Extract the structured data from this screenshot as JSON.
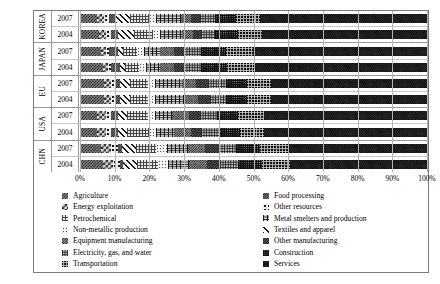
{
  "chart_data": {
    "type": "bar",
    "orientation": "horizontal",
    "stacked": true,
    "normalized": true,
    "title": "",
    "xlabel": "",
    "ylabel": "",
    "xlim": [
      0,
      100
    ],
    "xtick_labels": [
      "0%",
      "10%",
      "20%",
      "30%",
      "40%",
      "50%",
      "60%",
      "70%",
      "80%",
      "90%",
      "100%"
    ],
    "xtick_values": [
      0,
      10,
      20,
      30,
      40,
      50,
      60,
      70,
      80,
      90,
      100
    ],
    "grid": true,
    "legend_position": "bottom",
    "legend_columns": 2,
    "categories": [
      "Agriculture",
      "Energy exploitation",
      "Petrochemical",
      "Non-metallic production",
      "Equipment manufacturing",
      "Electricity, gas, and water",
      "Transportation",
      "Food processing",
      "Other resources",
      "Metal smelters and production",
      "Textiles and apparel",
      "Other manufacturing",
      "Construction",
      "Services"
    ],
    "category_keys": [
      "agriculture",
      "energy",
      "petrochemical",
      "nonmetallic",
      "equipment",
      "electricity",
      "transportation",
      "food",
      "otherres",
      "metal",
      "textiles",
      "othermfg",
      "construction",
      "services"
    ],
    "segment_order": [
      "agriculture",
      "energy",
      "otherres",
      "food",
      "textiles",
      "petrochemical",
      "nonmetallic",
      "metal",
      "equipment",
      "othermfg",
      "electricity",
      "construction",
      "transportation",
      "services"
    ],
    "groups": [
      {
        "name": "KOREA",
        "rows": [
          {
            "year": "2007",
            "values": {
              "agriculture": 5.0,
              "energy": 2.0,
              "otherres": 1.5,
              "food": 2.0,
              "textiles": 4.0,
              "petrochemical": 5.5,
              "nonmetallic": 2.0,
              "metal": 7.0,
              "equipment": 3.0,
              "othermfg": 2.5,
              "electricity": 4.5,
              "construction": 6.0,
              "transportation": 7.0,
              "services": 48.0
            }
          },
          {
            "year": "2004",
            "values": {
              "agriculture": 5.5,
              "energy": 2.0,
              "otherres": 1.5,
              "food": 2.0,
              "textiles": 4.5,
              "petrochemical": 5.5,
              "nonmetallic": 2.0,
              "metal": 6.5,
              "equipment": 3.0,
              "othermfg": 2.5,
              "electricity": 4.0,
              "construction": 6.5,
              "transportation": 7.0,
              "services": 47.5
            }
          }
        ]
      },
      {
        "name": "JAPAN",
        "rows": [
          {
            "year": "2007",
            "values": {
              "agriculture": 6.0,
              "energy": 1.5,
              "otherres": 1.0,
              "food": 2.5,
              "textiles": 1.5,
              "petrochemical": 4.0,
              "nonmetallic": 2.0,
              "metal": 4.5,
              "equipment": 4.0,
              "othermfg": 3.0,
              "electricity": 5.0,
              "construction": 7.0,
              "transportation": 8.0,
              "services": 50.0
            }
          },
          {
            "year": "2004",
            "values": {
              "agriculture": 6.5,
              "energy": 1.5,
              "otherres": 1.0,
              "food": 2.5,
              "textiles": 1.5,
              "petrochemical": 4.0,
              "nonmetallic": 2.0,
              "metal": 4.0,
              "equipment": 4.0,
              "othermfg": 3.0,
              "electricity": 5.0,
              "construction": 7.5,
              "transportation": 8.0,
              "services": 49.5
            }
          }
        ]
      },
      {
        "name": "EU",
        "rows": [
          {
            "year": "2007",
            "values": {
              "agriculture": 7.0,
              "energy": 2.0,
              "otherres": 1.5,
              "food": 1.0,
              "textiles": 3.0,
              "petrochemical": 5.0,
              "nonmetallic": 2.0,
              "metal": 8.0,
              "equipment": 4.0,
              "othermfg": 3.5,
              "electricity": 5.0,
              "construction": 6.0,
              "transportation": 7.0,
              "services": 45.0
            }
          },
          {
            "year": "2004",
            "values": {
              "agriculture": 7.0,
              "energy": 2.0,
              "otherres": 1.5,
              "food": 1.0,
              "textiles": 3.0,
              "petrochemical": 5.0,
              "nonmetallic": 2.0,
              "metal": 8.5,
              "equipment": 4.0,
              "othermfg": 3.5,
              "electricity": 4.5,
              "construction": 6.0,
              "transportation": 7.0,
              "services": 45.0
            }
          }
        ]
      },
      {
        "name": "USA",
        "rows": [
          {
            "year": "2007",
            "values": {
              "agriculture": 5.0,
              "energy": 2.5,
              "otherres": 1.5,
              "food": 2.0,
              "textiles": 2.5,
              "petrochemical": 6.0,
              "nonmetallic": 2.0,
              "metal": 5.0,
              "equipment": 5.0,
              "othermfg": 3.0,
              "electricity": 5.0,
              "construction": 6.0,
              "transportation": 7.5,
              "services": 47.0
            }
          },
          {
            "year": "2004",
            "values": {
              "agriculture": 5.0,
              "energy": 2.5,
              "otherres": 1.5,
              "food": 2.0,
              "textiles": 2.5,
              "petrochemical": 6.5,
              "nonmetallic": 2.0,
              "metal": 5.0,
              "equipment": 5.0,
              "othermfg": 3.0,
              "electricity": 5.0,
              "construction": 6.0,
              "transportation": 7.0,
              "services": 47.0
            }
          }
        ]
      },
      {
        "name": "CHN",
        "rows": [
          {
            "year": "2007",
            "values": {
              "agriculture": 6.0,
              "energy": 3.0,
              "otherres": 2.0,
              "food": 1.0,
              "textiles": 4.0,
              "petrochemical": 6.0,
              "nonmetallic": 3.0,
              "metal": 6.0,
              "equipment": 5.0,
              "othermfg": 4.0,
              "electricity": 5.0,
              "construction": 7.0,
              "transportation": 8.0,
              "services": 40.0
            }
          },
          {
            "year": "2004",
            "values": {
              "agriculture": 6.5,
              "energy": 3.0,
              "otherres": 2.0,
              "food": 1.0,
              "textiles": 4.0,
              "petrochemical": 6.0,
              "nonmetallic": 3.0,
              "metal": 6.0,
              "equipment": 5.0,
              "othermfg": 4.0,
              "electricity": 5.0,
              "construction": 7.0,
              "transportation": 8.0,
              "services": 39.5
            }
          }
        ]
      }
    ]
  },
  "legend": {
    "left_column": [
      "Agriculture",
      "Energy exploitation",
      "Petrochemical",
      "Non-metallic production",
      "Equipment manufacturing",
      "Electricity, gas, and water",
      "Transportation"
    ],
    "left_column_keys": [
      "agriculture",
      "energy",
      "petrochemical",
      "nonmetallic",
      "equipment",
      "electricity",
      "transportation"
    ],
    "right_column": [
      "Food processing",
      "Other resources",
      "Metal smelters and production",
      "Textiles and apparel",
      "Other manufacturing",
      "Construction",
      "Services"
    ],
    "right_column_keys": [
      "food",
      "otherres",
      "metal",
      "textiles",
      "othermfg",
      "construction",
      "services"
    ]
  }
}
